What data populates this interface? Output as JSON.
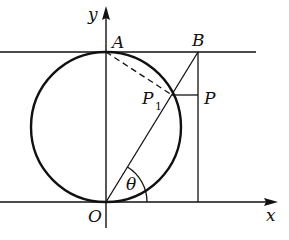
{
  "diagram": {
    "type": "geometry",
    "colors": {
      "stroke": "#111111",
      "background": "#ffffff"
    },
    "axes": {
      "x_label": "x",
      "y_label": "y"
    },
    "points": {
      "O": {
        "label": "O",
        "x": 106,
        "y": 202
      },
      "A": {
        "label": "A",
        "x": 106,
        "y": 52
      },
      "B": {
        "label": "B",
        "x": 198,
        "y": 52
      },
      "P1": {
        "label": "P",
        "subscript": "1",
        "x": 172,
        "y": 95
      },
      "P": {
        "label": "P",
        "x": 198,
        "y": 95
      }
    },
    "circle": {
      "cx": 106,
      "cy": 127,
      "r": 75
    },
    "angle": {
      "label": "θ",
      "vertex": "O",
      "between": [
        "x-axis",
        "OB"
      ]
    },
    "segments": [
      {
        "from": "O",
        "to": "B",
        "style": "solid"
      },
      {
        "from": "A",
        "to": "P1",
        "style": "dashed"
      },
      {
        "from": "P1",
        "to": "P",
        "style": "solid"
      },
      {
        "from": "B",
        "to": "x-axis",
        "style": "solid"
      }
    ]
  }
}
